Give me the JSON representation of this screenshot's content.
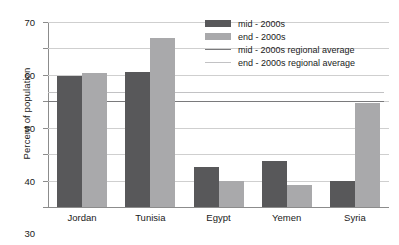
{
  "chart_data": {
    "type": "bar",
    "title": "",
    "xlabel": "",
    "ylabel": "Percent of population",
    "ylim": [
      0,
      70
    ],
    "ytick_step": 10,
    "yticks": [
      "0",
      "10",
      "20",
      "30",
      "40",
      "50",
      "60",
      "70"
    ],
    "grid": true,
    "legend_position": "top-center-right",
    "categories": [
      "Jordan",
      "Tunisia",
      "Egypt",
      "Yemen",
      "Syria"
    ],
    "series": [
      {
        "name": "mid - 2000s",
        "type": "bar",
        "color": "#58585a",
        "values": [
          49.5,
          51,
          15,
          17.5,
          10
        ]
      },
      {
        "name": "end - 2000s",
        "type": "bar",
        "color": "#a9a9ab",
        "values": [
          50.8,
          64,
          10,
          8.5,
          39.5
        ]
      },
      {
        "name": "mid - 2000s regional average",
        "type": "hline",
        "color": "#7a7a7c",
        "value": 40
      },
      {
        "name": "end - 2000s regional average",
        "type": "hline",
        "color": "#c2c2c4",
        "value": 43.5
      }
    ]
  },
  "axis": {
    "y_title": "Percent of population"
  },
  "legend": {
    "items": [
      {
        "label": "mid - 2000s",
        "marker": "swatch",
        "color": "#58585a"
      },
      {
        "label": "end - 2000s",
        "marker": "swatch",
        "color": "#a9a9ab"
      },
      {
        "label": "mid - 2000s regional average",
        "marker": "line",
        "color": "#7a7a7c"
      },
      {
        "label": "end - 2000s regional average",
        "marker": "line",
        "color": "#c2c2c4"
      }
    ]
  }
}
